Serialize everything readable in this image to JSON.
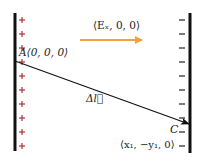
{
  "diagram": {
    "colors": {
      "plate": "#111111",
      "plus": "#b0303a",
      "minus": "#222222",
      "field_arrow": "#f3a13c",
      "path": "#111111",
      "text": "#222222"
    },
    "left_plate": {
      "charge_symbol": "+",
      "count": 10
    },
    "right_plate": {
      "charge_symbol": "–",
      "count": 10
    },
    "field": {
      "label": "⟨Eₓ, 0, 0⟩"
    },
    "point_a": {
      "label": "A⟨0, 0, 0⟩"
    },
    "displacement": {
      "label": "Δl⃗"
    },
    "point_c": {
      "name": "C",
      "coords": "⟨x₁, −y₁, 0⟩"
    }
  }
}
